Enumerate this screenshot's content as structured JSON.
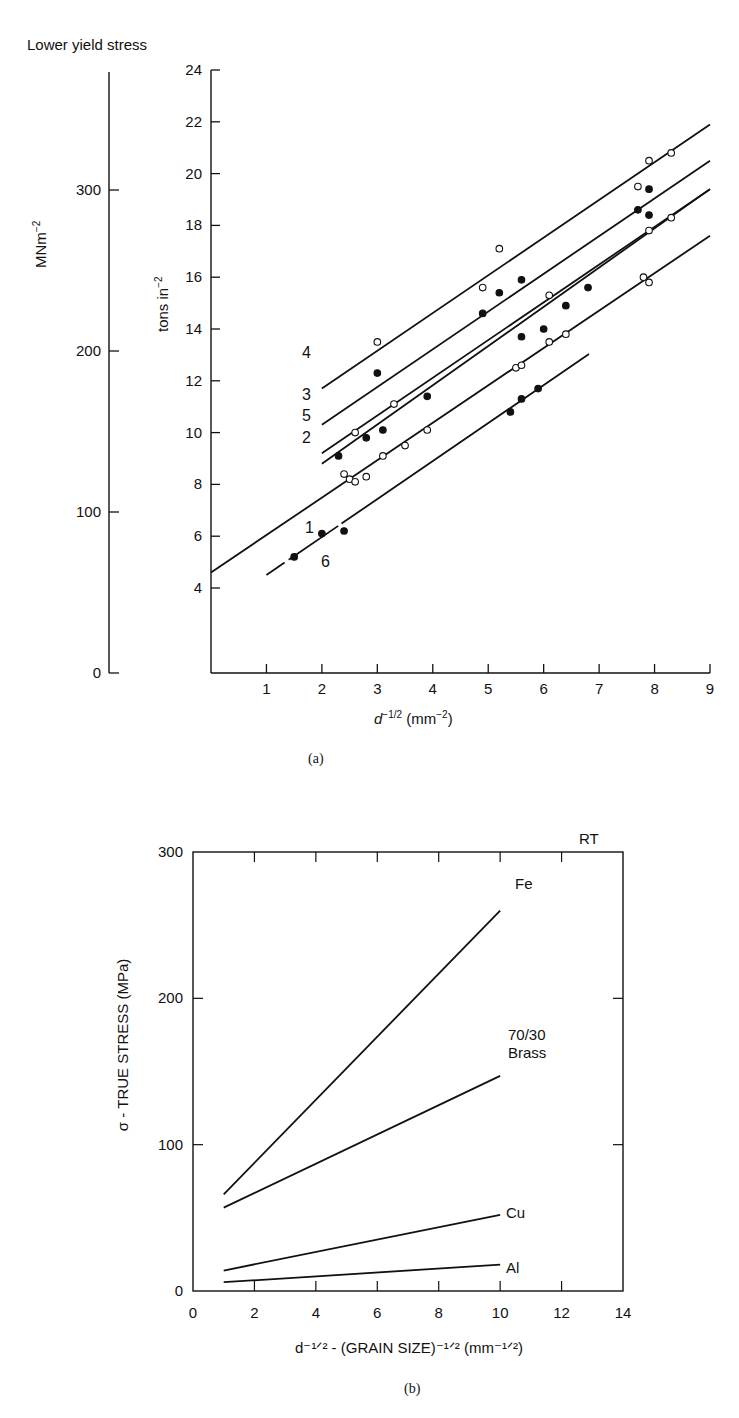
{
  "figure": {
    "panel_a_caption": "(a)",
    "panel_b_caption": "(b)"
  },
  "chart_data": [
    {
      "id": "a",
      "type": "scatter",
      "title": "Lower yield stress",
      "xlabel": "d^-1/2 (mm^-2)",
      "ylabel": "tons in^-2",
      "ylabel_secondary": "MNm^-2",
      "xlim": [
        0,
        9
      ],
      "ylim": [
        2,
        24
      ],
      "ylim_secondary": [
        0,
        350
      ],
      "x_ticks": [
        1,
        2,
        3,
        4,
        5,
        6,
        7,
        8,
        9
      ],
      "y_ticks": [
        4,
        6,
        8,
        10,
        12,
        14,
        16,
        18,
        20,
        22,
        24
      ],
      "y_ticks_secondary": [
        0,
        100,
        200,
        300
      ],
      "grid": false,
      "series": [
        {
          "name": "1",
          "line": {
            "x": [
              0,
              9
            ],
            "y": [
              4.6,
              17.6
            ]
          },
          "points": [
            {
              "x": 2.4,
              "y": 8.4,
              "filled": false
            },
            {
              "x": 2.5,
              "y": 8.2,
              "filled": false
            },
            {
              "x": 2.6,
              "y": 8.1,
              "filled": false
            },
            {
              "x": 2.8,
              "y": 8.3,
              "filled": false
            },
            {
              "x": 3.1,
              "y": 9.1,
              "filled": false
            },
            {
              "x": 3.5,
              "y": 9.5,
              "filled": false
            },
            {
              "x": 3.9,
              "y": 10.1,
              "filled": false
            },
            {
              "x": 5.5,
              "y": 12.5,
              "filled": false
            },
            {
              "x": 5.6,
              "y": 12.6,
              "filled": false
            },
            {
              "x": 6.1,
              "y": 13.5,
              "filled": false
            },
            {
              "x": 6.4,
              "y": 13.8,
              "filled": false
            },
            {
              "x": 7.8,
              "y": 16.0,
              "filled": false
            },
            {
              "x": 7.9,
              "y": 15.8,
              "filled": false
            }
          ]
        },
        {
          "name": "2",
          "line": {
            "x": [
              2.0,
              9
            ],
            "y": [
              8.8,
              19.4
            ]
          },
          "points": [
            {
              "x": 2.3,
              "y": 9.1,
              "filled": true
            },
            {
              "x": 2.8,
              "y": 9.8,
              "filled": true
            },
            {
              "x": 3.1,
              "y": 10.1,
              "filled": true
            },
            {
              "x": 3.9,
              "y": 11.4,
              "filled": true
            },
            {
              "x": 5.6,
              "y": 13.7,
              "filled": true
            },
            {
              "x": 6.0,
              "y": 14.0,
              "filled": true
            },
            {
              "x": 6.4,
              "y": 14.9,
              "filled": true
            },
            {
              "x": 6.8,
              "y": 15.6,
              "filled": true
            }
          ]
        },
        {
          "name": "5",
          "line": {
            "x": [
              2.0,
              9
            ],
            "y": [
              9.2,
              19.4
            ]
          },
          "points": [
            {
              "x": 2.6,
              "y": 10.0,
              "filled": false
            },
            {
              "x": 3.3,
              "y": 11.1,
              "filled": false
            },
            {
              "x": 6.1,
              "y": 15.3,
              "filled": false
            },
            {
              "x": 7.9,
              "y": 17.8,
              "filled": false
            },
            {
              "x": 8.3,
              "y": 18.3,
              "filled": false
            }
          ]
        },
        {
          "name": "3",
          "line": {
            "x": [
              2.0,
              9
            ],
            "y": [
              10.3,
              20.5
            ]
          },
          "points": [
            {
              "x": 3.0,
              "y": 12.3,
              "filled": true
            },
            {
              "x": 4.9,
              "y": 14.6,
              "filled": true
            },
            {
              "x": 5.2,
              "y": 15.4,
              "filled": true
            },
            {
              "x": 5.6,
              "y": 15.9,
              "filled": true
            },
            {
              "x": 7.7,
              "y": 18.6,
              "filled": true
            },
            {
              "x": 7.9,
              "y": 18.4,
              "filled": true
            },
            {
              "x": 7.9,
              "y": 19.4,
              "filled": true
            }
          ]
        },
        {
          "name": "4",
          "line": {
            "x": [
              2.0,
              9
            ],
            "y": [
              11.7,
              21.9
            ]
          },
          "points": [
            {
              "x": 3.0,
              "y": 13.5,
              "filled": false
            },
            {
              "x": 4.9,
              "y": 15.6,
              "filled": false
            },
            {
              "x": 5.2,
              "y": 17.1,
              "filled": false
            },
            {
              "x": 7.7,
              "y": 19.5,
              "filled": false
            },
            {
              "x": 7.9,
              "y": 20.5,
              "filled": false
            },
            {
              "x": 8.3,
              "y": 20.8,
              "filled": false
            }
          ]
        },
        {
          "name": "6",
          "line": {
            "x": [
              1.0,
              7.0
            ],
            "y": [
              4.5,
              13.3
            ]
          },
          "points": [
            {
              "x": 1.5,
              "y": 5.2,
              "filled": true
            },
            {
              "x": 2.0,
              "y": 6.1,
              "filled": true
            },
            {
              "x": 2.4,
              "y": 6.2,
              "filled": true
            },
            {
              "x": 5.4,
              "y": 10.8,
              "filled": true
            },
            {
              "x": 5.6,
              "y": 11.3,
              "filled": true
            },
            {
              "x": 5.9,
              "y": 11.7,
              "filled": true
            }
          ]
        }
      ]
    },
    {
      "id": "b",
      "type": "line",
      "title": "",
      "annotation": "RT",
      "xlabel": "d^-1/2 - (GRAIN SIZE)^-1/2 (mm^-1/2)",
      "ylabel": "σ - TRUE STRESS (MPa)",
      "xlim": [
        0,
        14
      ],
      "ylim": [
        0,
        300
      ],
      "x_ticks": [
        0,
        2,
        4,
        6,
        8,
        10,
        12,
        14
      ],
      "y_ticks": [
        0,
        100,
        200,
        300
      ],
      "grid": false,
      "series": [
        {
          "name": "Fe",
          "x": [
            1,
            10
          ],
          "values": [
            66,
            260
          ]
        },
        {
          "name": "70/30 Brass",
          "x": [
            1,
            10
          ],
          "values": [
            57,
            147
          ]
        },
        {
          "name": "Cu",
          "x": [
            1,
            10
          ],
          "values": [
            14,
            52
          ]
        },
        {
          "name": "Al",
          "x": [
            1,
            10
          ],
          "values": [
            6,
            18
          ]
        }
      ]
    }
  ],
  "labels": {
    "a_title": "Lower yield stress",
    "a_ylabel": "tons in",
    "a_ylabel_sec": "MNm",
    "a_xlabel_d": "d",
    "a_xlabel_rest": " (mm",
    "b_rt": "RT",
    "b_fe": "Fe",
    "b_brass1": "70/30",
    "b_brass2": "Brass",
    "b_cu": "Cu",
    "b_al": "Al",
    "b_ylabel": "σ - TRUE STRESS (MPa)",
    "b_xlabel": "d⁻¹ᐟ² - (GRAIN SIZE)⁻¹ᐟ² (mm⁻¹ᐟ²)"
  }
}
